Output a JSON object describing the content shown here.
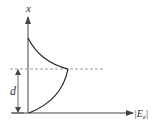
{
  "diagram": {
    "y_axis_label": "x",
    "x_axis_label": "|E",
    "x_axis_label_sub": "z",
    "x_axis_label_end": "|",
    "dimension_label": "d",
    "colors": {
      "axis": "#444444",
      "curve": "#222222",
      "dashed": "#999999"
    }
  }
}
